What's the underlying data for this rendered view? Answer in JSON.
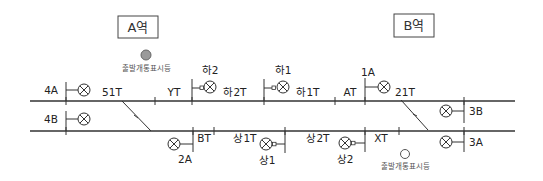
{
  "stations": [
    {
      "id": "A",
      "label": "A역"
    },
    {
      "id": "B",
      "label": "B역"
    }
  ],
  "indicators": [
    {
      "id": "departure-indicator-a",
      "label": "출발개통표시등",
      "state": "lit",
      "color": "#9a9a9a"
    },
    {
      "id": "departure-indicator-b",
      "label": "출발개통표시등",
      "state": "unlit",
      "color": "#ffffff"
    }
  ],
  "signals": {
    "s4A": "4A",
    "s4B": "4B",
    "sHa2": "하2",
    "sHa1": "하1",
    "s1A": "1A",
    "s3B": "3B",
    "s3A": "3A",
    "s2A": "2A",
    "sSang1": "상1",
    "sSang2": "상2"
  },
  "track_circuits": {
    "t51T": "51T",
    "tYT": "YT",
    "tHa2T": "하2T",
    "tHa1T": "하1T",
    "tAT": "AT",
    "t21T": "21T",
    "tBT": "BT",
    "tSang1T": "상1T",
    "tSang2T": "상2T",
    "tXT": "XT"
  },
  "colors": {
    "line": "#333333",
    "lit_lamp": "#9a9a9a"
  }
}
